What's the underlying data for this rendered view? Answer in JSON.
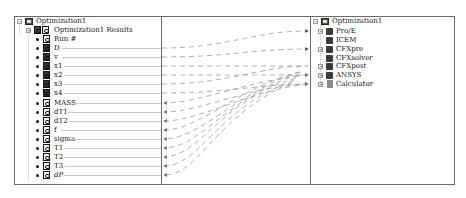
{
  "left_tree": {
    "root": "Optimization1",
    "results_node": "Optimization1 Results",
    "run_label": "Run #",
    "inputs": [
      "D",
      "v",
      "x1",
      "x2",
      "x3",
      "x4"
    ],
    "outputs": [
      "MASS",
      "dT1",
      "dT2",
      "f",
      "sigma",
      "T1",
      "T2",
      "T3",
      "dP"
    ]
  },
  "right_tree": {
    "root": "Optimization1",
    "components": [
      {
        "label": "Pro/E",
        "expandable": true,
        "icon": "component-icon"
      },
      {
        "label": "ICEM",
        "expandable": false,
        "icon": "component-icon"
      },
      {
        "label": "CFXpre",
        "expandable": true,
        "icon": "component-icon"
      },
      {
        "label": "CFXsolver",
        "expandable": false,
        "icon": "component-icon"
      },
      {
        "label": "CFXpost",
        "expandable": true,
        "icon": "component-icon"
      },
      {
        "label": "ANSYS",
        "expandable": true,
        "icon": "component-icon"
      },
      {
        "label": "Calculator",
        "expandable": true,
        "icon": "calculator-icon"
      }
    ]
  },
  "colors": {
    "border": "#6a6a6a",
    "link_line": "#9a9a9a",
    "row_line": "#c8c8c8"
  }
}
